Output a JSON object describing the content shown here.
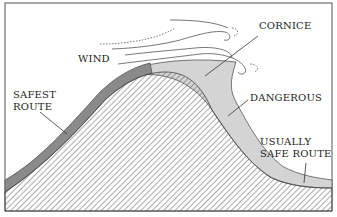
{
  "diagram": {
    "labels": {
      "wind": "WIND",
      "cornice": "CORNICE",
      "safest_route_line1": "SAFEST",
      "safest_route_line2": "ROUTE",
      "dangerous": "DANGEROUS",
      "usually_safe_line1": "USUALLY",
      "usually_safe_line2": "SAFE ROUTE"
    },
    "colors": {
      "border": "#555555",
      "hatch": "#444444",
      "snow_dark": "#8a8a8a",
      "snow_light": "#d4d4d4",
      "background": "#ffffff"
    }
  }
}
